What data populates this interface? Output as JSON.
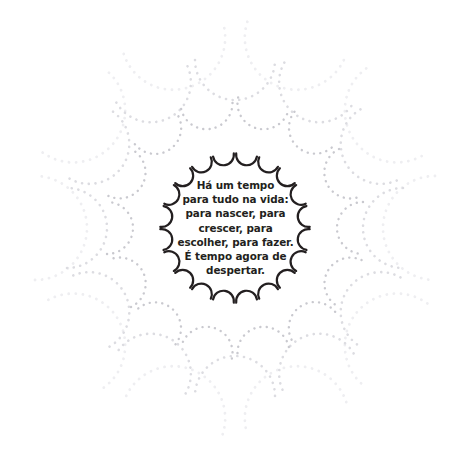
{
  "canvas": {
    "width": 471,
    "height": 461,
    "background_color": "#ffffff"
  },
  "quote": {
    "language": "pt-BR",
    "full_text": "Há um tempo para tudo na vida: para nascer, para crescer, para escolher, para fazer. É tempo agora de despertar.",
    "text_color": "#231f20",
    "lines": [
      "Há um tempo",
      "para tudo na vida:",
      "para nascer, para",
      "crescer, para",
      "escolher, para fazer.",
      "É tempo agora de",
      "despertar."
    ]
  },
  "ornament": {
    "name": "scalloped-mandala",
    "center_x": 235,
    "center_y": 228,
    "rings": [
      {
        "id": "ring-inner",
        "ring_radius": 74,
        "scallop_count": 20,
        "scallop_radius": 10.5,
        "stroke_color": "#231f20",
        "stroke_width": 2.2,
        "style": "solid",
        "phase_deg": 9
      },
      {
        "id": "ring-second",
        "ring_radius": 128,
        "scallop_count": 14,
        "scallop_radius": 26,
        "stroke_color": "#c9c9cf",
        "stroke_width": 2.4,
        "style": "dotted",
        "dash": "0.1 6.2",
        "phase_deg": 12.85
      },
      {
        "id": "ring-third",
        "ring_radius": 168,
        "scallop_count": 12,
        "scallop_radius": 40,
        "stroke_color": "#dcdce1",
        "stroke_width": 2.6,
        "style": "dotted",
        "dash": "0.1 6.6",
        "phase_deg": 0
      },
      {
        "id": "ring-outer",
        "ring_radius": 200,
        "scallop_count": 10,
        "scallop_radius": 52,
        "stroke_color": "#eeeef1",
        "stroke_width": 2.8,
        "style": "dotted",
        "dash": "0.1 7.0",
        "phase_deg": 18
      }
    ]
  }
}
